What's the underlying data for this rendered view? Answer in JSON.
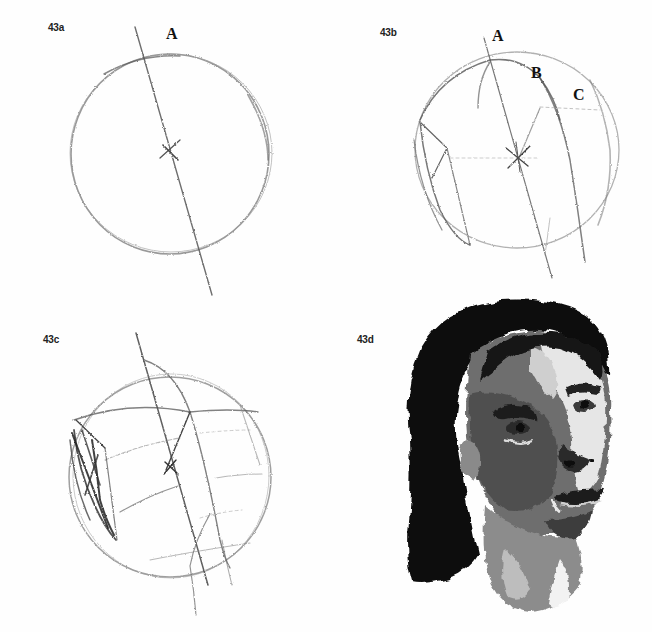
{
  "page": {
    "type": "scanned book page — head construction drawing steps",
    "top_text_fragment": "…"
  },
  "figures": [
    {
      "id": "43a",
      "label": "43a",
      "description": "Pencil circle with tilted central axis and cross at center",
      "annotations": [
        {
          "text": "A",
          "x": 166,
          "y": 25
        }
      ]
    },
    {
      "id": "43b",
      "label": "43b",
      "description": "Circle with tilted axis, curved contour lines and side plane",
      "annotations": [
        {
          "text": "A",
          "x": 492,
          "y": 27
        },
        {
          "text": "B",
          "x": 531,
          "y": 64
        },
        {
          "text": "C",
          "x": 573,
          "y": 86
        }
      ]
    },
    {
      "id": "43c",
      "label": "43c",
      "description": "Circle with construction grid lines, axis and shaded side plane"
    },
    {
      "id": "43d",
      "label": "43d",
      "description": "Watercolor portrait of a woman with dark hair, head tilted looking up-right"
    }
  ],
  "colors": {
    "paper": "#fefefe",
    "pencil": "#555555",
    "pencil_dark": "#2a2a2a",
    "hair": "#0c0c0c",
    "skin_dark": "#4a4a4a",
    "skin_mid": "#7a7a7a",
    "skin_light": "#d8d8d8"
  }
}
